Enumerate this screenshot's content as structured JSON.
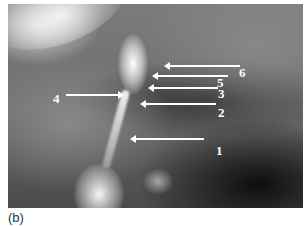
{
  "figure": {
    "caption": "(b)",
    "type": "grayscale photograph with annotated arrows",
    "annotations": [
      {
        "label": "1",
        "direction": "left"
      },
      {
        "label": "2",
        "direction": "left"
      },
      {
        "label": "3",
        "direction": "left"
      },
      {
        "label": "4",
        "direction": "right"
      },
      {
        "label": "5",
        "direction": "left"
      },
      {
        "label": "6",
        "direction": "left"
      }
    ]
  }
}
